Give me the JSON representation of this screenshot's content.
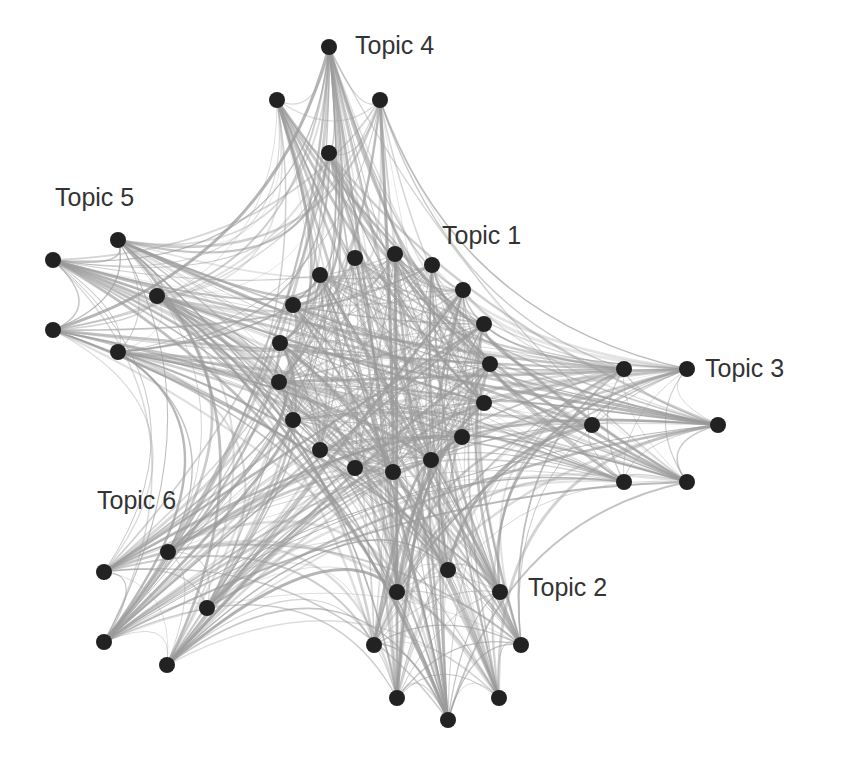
{
  "diagram": {
    "type": "network-graph",
    "node_color": "#222222",
    "edge_color": "#9a9a9a",
    "background": "#ffffff",
    "clusters": [
      {
        "id": "topic4",
        "label": "Topic 4",
        "label_pos": [
          355,
          53
        ],
        "nodes": [
          [
            329,
            47
          ],
          [
            277,
            100
          ],
          [
            380,
            100
          ],
          [
            329,
            153
          ]
        ]
      },
      {
        "id": "topic5",
        "label": "Topic 5",
        "label_pos": [
          55,
          205
        ],
        "nodes": [
          [
            53,
            260
          ],
          [
            118,
            240
          ],
          [
            157,
            296
          ],
          [
            53,
            330
          ],
          [
            118,
            352
          ]
        ]
      },
      {
        "id": "topic1",
        "label": "Topic 1",
        "label_pos": [
          442,
          243
        ],
        "nodes": [
          [
            280,
            343
          ],
          [
            279,
            382
          ],
          [
            293,
            420
          ],
          [
            320,
            450
          ],
          [
            355,
            468
          ],
          [
            393,
            472
          ],
          [
            431,
            460
          ],
          [
            462,
            437
          ],
          [
            484,
            403
          ],
          [
            490,
            364
          ],
          [
            484,
            324
          ],
          [
            463,
            290
          ],
          [
            432,
            265
          ],
          [
            395,
            254
          ],
          [
            355,
            258
          ],
          [
            320,
            275
          ],
          [
            293,
            305
          ]
        ]
      },
      {
        "id": "topic3",
        "label": "Topic 3",
        "label_pos": [
          705,
          376
        ],
        "nodes": [
          [
            624,
            369
          ],
          [
            687,
            369
          ],
          [
            592,
            425
          ],
          [
            718,
            425
          ],
          [
            624,
            482
          ],
          [
            687,
            482
          ]
        ]
      },
      {
        "id": "topic6",
        "label": "Topic 6",
        "label_pos": [
          97,
          508
        ],
        "nodes": [
          [
            168,
            552
          ],
          [
            104,
            572
          ],
          [
            207,
            608
          ],
          [
            104,
            642
          ],
          [
            167,
            665
          ]
        ]
      },
      {
        "id": "topic2",
        "label": "Topic 2",
        "label_pos": [
          528,
          595
        ],
        "nodes": [
          [
            448,
            570
          ],
          [
            397,
            592
          ],
          [
            500,
            592
          ],
          [
            374,
            645
          ],
          [
            521,
            645
          ],
          [
            397,
            698
          ],
          [
            499,
            698
          ],
          [
            448,
            720
          ]
        ]
      }
    ],
    "node_radius": 8
  }
}
